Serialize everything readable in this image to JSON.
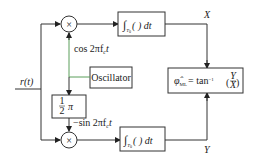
{
  "diagram": {
    "input": {
      "label": "r(t)"
    },
    "multipliers": [
      {
        "id": "mult-top",
        "symbol": "×"
      },
      {
        "id": "mult-bottom",
        "symbol": "×"
      }
    ],
    "oscillator": {
      "label": "Oscillator"
    },
    "phase_shift": {
      "label_num": "1",
      "label_den": "2",
      "label_pi": "π"
    },
    "carriers": {
      "cos": "cos 2πf",
      "cos_sub": "c",
      "cos_t": "t",
      "sin": "−sin 2πf",
      "sin_sub": "c",
      "sin_t": "t"
    },
    "integrators": [
      {
        "id": "int-top",
        "integral": "∫",
        "sub": "T",
        "sub2": "0",
        "body": "( ) dt"
      },
      {
        "id": "int-bottom",
        "integral": "∫",
        "sub": "T",
        "sub2": "0",
        "body": "( ) dt"
      }
    ],
    "outputs": {
      "x": "X",
      "y": "Y"
    },
    "estimator": {
      "phi": "φ̂",
      "sub": "ML",
      "eq": "= tan",
      "sup": "−1",
      "num": "Y",
      "den": "X"
    }
  }
}
